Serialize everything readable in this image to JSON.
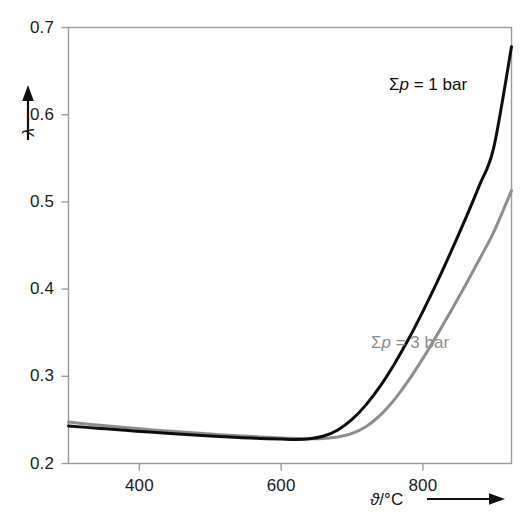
{
  "chart_data": {
    "type": "line",
    "title": "",
    "subtitle": "",
    "xlabel": "ϑ/°C",
    "ylabel": "λ",
    "xlabel_symbol": "ϑ",
    "xlabel_unit": "/°C",
    "xlabel_has_arrow": true,
    "ylabel_has_arrow": true,
    "grid": false,
    "legend_position": "inline-annotations",
    "xlim": [
      300,
      925
    ],
    "ylim": [
      0.2,
      0.7
    ],
    "xticks": [
      400,
      600,
      800
    ],
    "xtick_labels": [
      "400",
      "600",
      "800"
    ],
    "yticks": [
      0.2,
      0.3,
      0.4,
      0.5,
      0.6,
      0.7
    ],
    "ytick_labels": [
      "0.2",
      "0.3",
      "0.4",
      "0.5",
      "0.6",
      "0.7"
    ],
    "series": [
      {
        "name": "Σp = 1 bar",
        "label_sum": "Σ",
        "label_var": "p",
        "label_rest": " = 1 bar",
        "color": "#0d0d0d",
        "width": 3.0,
        "x": [
          300,
          340,
          380,
          420,
          460,
          500,
          540,
          570,
          600,
          620,
          640,
          660,
          680,
          700,
          720,
          740,
          760,
          780,
          800,
          820,
          840,
          860,
          880,
          900,
          925
        ],
        "y": [
          0.243,
          0.2405,
          0.238,
          0.2357,
          0.2335,
          0.2316,
          0.2298,
          0.2288,
          0.228,
          0.2276,
          0.2283,
          0.2315,
          0.2385,
          0.2505,
          0.2675,
          0.289,
          0.3145,
          0.343,
          0.3745,
          0.408,
          0.4435,
          0.4805,
          0.5195,
          0.5625,
          0.678
        ]
      },
      {
        "name": "Σp = 3 bar",
        "label_sum": "Σ",
        "label_var": "p",
        "label_rest": " = 3 bar",
        "color": "#8d8d8d",
        "width": 3.0,
        "x": [
          300,
          340,
          380,
          420,
          460,
          500,
          540,
          570,
          600,
          620,
          640,
          660,
          680,
          700,
          720,
          740,
          760,
          780,
          800,
          820,
          840,
          860,
          880,
          900,
          925
        ],
        "y": [
          0.2475,
          0.2442,
          0.2412,
          0.2385,
          0.236,
          0.2338,
          0.2318,
          0.2305,
          0.2293,
          0.2288,
          0.2285,
          0.2288,
          0.2305,
          0.2345,
          0.2425,
          0.2555,
          0.2735,
          0.2955,
          0.3205,
          0.3475,
          0.3755,
          0.4045,
          0.4345,
          0.4655,
          0.513
        ]
      }
    ]
  },
  "axes": {
    "frame_color": "#9a9a9a",
    "tick_color": "#9a9a9a",
    "text_color": "#1a1a1a"
  }
}
